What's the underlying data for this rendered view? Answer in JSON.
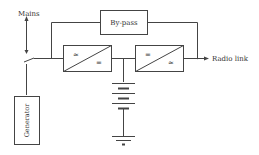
{
  "diagram": {
    "labels": {
      "mains": "Mains",
      "bypass": "By-pass",
      "radio_link": "Radio link",
      "generator": "Generator"
    },
    "converters": [
      {
        "left_symbol": "≈",
        "right_symbol": "="
      },
      {
        "left_symbol": "=",
        "right_symbol": "≈"
      }
    ],
    "colors": {
      "stroke": "#444444",
      "background": "#ffffff"
    }
  }
}
